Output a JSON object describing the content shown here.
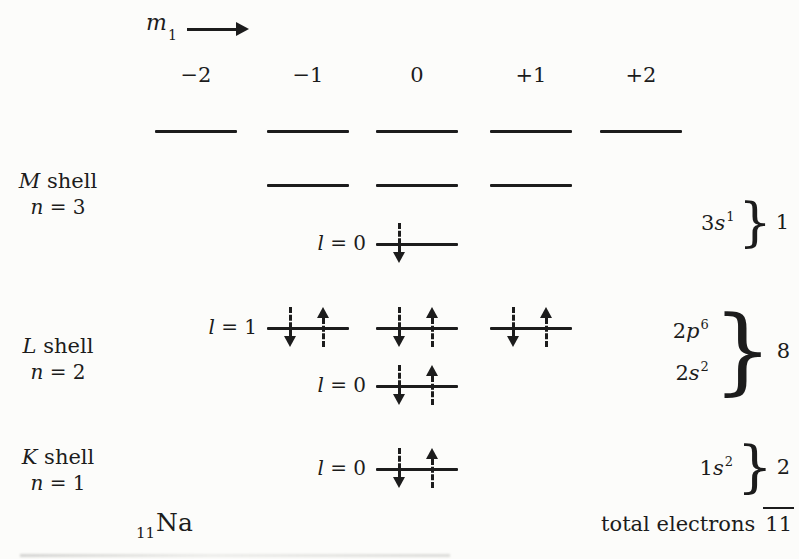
{
  "page": {
    "background": "#fcfcfa",
    "ink": "#1c1c1c"
  },
  "header": {
    "symbol": "m",
    "symbol_sub": "1",
    "columns": [
      "−2",
      "−1",
      "0",
      "+1",
      "+2"
    ]
  },
  "shells": [
    {
      "letter": "M",
      "word": "shell",
      "n_symbol": "n",
      "n_eq": " = 3"
    },
    {
      "letter": "L",
      "word": "shell",
      "n_symbol": "n",
      "n_eq": " = 2"
    },
    {
      "letter": "K",
      "word": "shell",
      "n_symbol": "n",
      "n_eq": " = 1"
    }
  ],
  "diagram": {
    "rows": [
      {
        "name": "3d",
        "y": 131,
        "label_l": null,
        "label_eq": null,
        "lines": [
          {
            "m": "-2",
            "arrows": []
          },
          {
            "m": "-1",
            "arrows": []
          },
          {
            "m": "0",
            "arrows": []
          },
          {
            "m": "+1",
            "arrows": []
          },
          {
            "m": "+2",
            "arrows": []
          }
        ]
      },
      {
        "name": "3p",
        "y": 185,
        "label_l": null,
        "label_eq": null,
        "lines": [
          {
            "m": "-1",
            "arrows": []
          },
          {
            "m": "0",
            "arrows": []
          },
          {
            "m": "+1",
            "arrows": []
          }
        ]
      },
      {
        "name": "3s",
        "y": 244,
        "label_l": "l",
        "label_eq": " = 0",
        "lines": [
          {
            "m": "0",
            "arrows": [
              "down"
            ]
          }
        ]
      },
      {
        "name": "2p",
        "y": 328,
        "label_l": "l",
        "label_eq": " = 1",
        "lines": [
          {
            "m": "-1",
            "arrows": [
              "down",
              "up"
            ]
          },
          {
            "m": "0",
            "arrows": [
              "down",
              "up"
            ]
          },
          {
            "m": "+1",
            "arrows": [
              "down",
              "up"
            ]
          }
        ]
      },
      {
        "name": "2s",
        "y": 386,
        "label_l": "l",
        "label_eq": " = 0",
        "lines": [
          {
            "m": "0",
            "arrows": [
              "down",
              "up"
            ]
          }
        ]
      },
      {
        "name": "1s",
        "y": 469,
        "label_l": "l",
        "label_eq": " = 0",
        "lines": [
          {
            "m": "0",
            "arrows": [
              "down",
              "up"
            ]
          }
        ]
      }
    ]
  },
  "annotations": [
    {
      "terms": [
        {
          "coef": "3",
          "orb": "s",
          "sup": "1"
        }
      ],
      "brace": "}",
      "count": "1"
    },
    {
      "terms": [
        {
          "coef": "2",
          "orb": "p",
          "sup": "6"
        },
        {
          "coef": "2",
          "orb": "s",
          "sup": "2"
        }
      ],
      "brace": "}",
      "count": "8"
    },
    {
      "terms": [
        {
          "coef": "1",
          "orb": "s",
          "sup": "2"
        }
      ],
      "brace": "}",
      "count": "2"
    }
  ],
  "footer": {
    "element_sub": "11",
    "element_symbol": "Na",
    "total_label": "total electrons",
    "total_value": "11"
  }
}
